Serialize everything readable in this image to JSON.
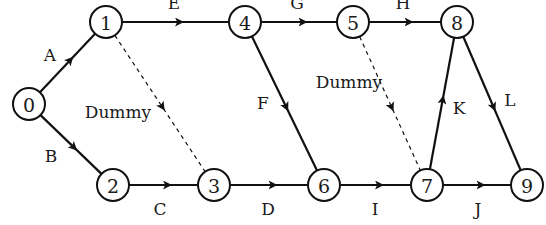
{
  "diagram": {
    "type": "activity-on-arrow network",
    "colors": {
      "stroke": "#111111",
      "background": "#ffffff",
      "text": "#1a1a1a"
    },
    "node_radius": 16,
    "nodes": [
      {
        "id": "0",
        "label": "0",
        "x": 29,
        "y": 104
      },
      {
        "id": "1",
        "label": "1",
        "x": 106,
        "y": 22
      },
      {
        "id": "2",
        "label": "2",
        "x": 113,
        "y": 185
      },
      {
        "id": "3",
        "label": "3",
        "x": 214,
        "y": 185
      },
      {
        "id": "4",
        "label": "4",
        "x": 245,
        "y": 22
      },
      {
        "id": "5",
        "label": "5",
        "x": 353,
        "y": 22
      },
      {
        "id": "6",
        "label": "6",
        "x": 324,
        "y": 185
      },
      {
        "id": "7",
        "label": "7",
        "x": 427,
        "y": 185
      },
      {
        "id": "8",
        "label": "8",
        "x": 457,
        "y": 22
      },
      {
        "id": "9",
        "label": "9",
        "x": 527,
        "y": 185
      }
    ],
    "edges": [
      {
        "from": "0",
        "to": "1",
        "label": "A",
        "dashed": false,
        "lx": 50,
        "ly": 55
      },
      {
        "from": "0",
        "to": "2",
        "label": "B",
        "dashed": false,
        "lx": 51,
        "ly": 156
      },
      {
        "from": "2",
        "to": "3",
        "label": "C",
        "dashed": false,
        "lx": 160,
        "ly": 209
      },
      {
        "from": "3",
        "to": "6",
        "label": "D",
        "dashed": false,
        "lx": 268,
        "ly": 209
      },
      {
        "from": "1",
        "to": "4",
        "label": "E",
        "dashed": false,
        "lx": 174,
        "ly": 3
      },
      {
        "from": "4",
        "to": "6",
        "label": "F",
        "dashed": false,
        "lx": 263,
        "ly": 103
      },
      {
        "from": "4",
        "to": "5",
        "label": "G",
        "dashed": false,
        "lx": 297,
        "ly": 3
      },
      {
        "from": "5",
        "to": "8",
        "label": "H",
        "dashed": false,
        "lx": 403,
        "ly": 3
      },
      {
        "from": "6",
        "to": "7",
        "label": "I",
        "dashed": false,
        "lx": 375,
        "ly": 209
      },
      {
        "from": "7",
        "to": "9",
        "label": "J",
        "dashed": false,
        "lx": 478,
        "ly": 209
      },
      {
        "from": "7",
        "to": "8",
        "label": "K",
        "dashed": false,
        "lx": 459,
        "ly": 108
      },
      {
        "from": "8",
        "to": "9",
        "label": "L",
        "dashed": false,
        "lx": 510,
        "ly": 100
      },
      {
        "from": "1",
        "to": "3",
        "label": "Dummy",
        "dashed": true,
        "lx": 118,
        "ly": 112
      },
      {
        "from": "5",
        "to": "7",
        "label": "Dummy",
        "dashed": true,
        "lx": 349,
        "ly": 82
      }
    ]
  }
}
